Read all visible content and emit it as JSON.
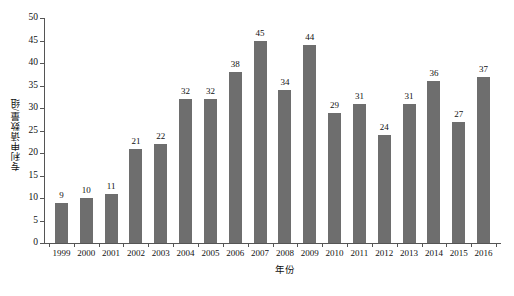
{
  "chart_data": {
    "type": "bar",
    "title": "",
    "subtitle": "",
    "xlabel": "年份",
    "ylabel": "专利申请数量/组",
    "categories": [
      "1999",
      "2000",
      "2001",
      "2002",
      "2003",
      "2004",
      "2005",
      "2006",
      "2007",
      "2008",
      "2009",
      "2010",
      "2011",
      "2012",
      "2013",
      "2014",
      "2015",
      "2016"
    ],
    "values": [
      9,
      10,
      11,
      21,
      22,
      32,
      32,
      38,
      45,
      34,
      44,
      29,
      31,
      24,
      31,
      36,
      27,
      37
    ],
    "value_labels": [
      "9",
      "10",
      "11",
      "21",
      "22",
      "32",
      "32",
      "38",
      "45",
      "34",
      "44",
      "29",
      "31",
      "24",
      "31",
      "36",
      "27",
      "37"
    ],
    "ylim": [
      0,
      50
    ],
    "ytick_values": [
      0,
      5,
      10,
      15,
      20,
      25,
      30,
      35,
      40,
      45,
      50
    ],
    "ytick_labels": [
      "0",
      "5",
      "10",
      "15",
      "20",
      "25",
      "30",
      "35",
      "40",
      "45",
      "50"
    ],
    "grid": false,
    "legend": null,
    "legend_position": "none",
    "bar_color": "#6e6e6e",
    "axis_color": "#555555",
    "background": "#ffffff",
    "text_color": "#111111"
  }
}
